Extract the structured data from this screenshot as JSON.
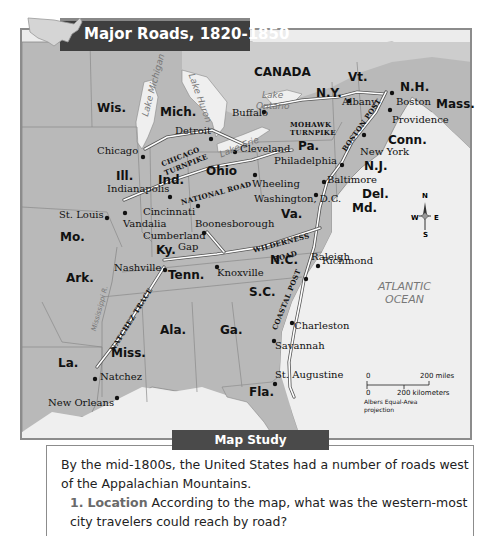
{
  "title": "Major Roads, 1820-1850",
  "country_label": "CANADA",
  "ocean_label": [
    "ATLANTIC",
    "OCEAN"
  ],
  "lakes": {
    "michigan": "Lake Michigan",
    "huron": "Lake Huron",
    "erie": "Lake Erie",
    "ontario_1": "Lake",
    "ontario_2": "Ontario"
  },
  "river": "Mississippi R.",
  "states": {
    "wis": "Wis.",
    "mich": "Mich.",
    "ny": "N.Y.",
    "vt": "Vt.",
    "nh": "N.H.",
    "mass": "Mass.",
    "conn": "Conn.",
    "pa": "Pa.",
    "nj": "N.J.",
    "del": "Del.",
    "md": "Md.",
    "ohio": "Ohio",
    "ind": "Ind.",
    "ill": "Ill.",
    "mo": "Mo.",
    "ky": "Ky.",
    "va": "Va.",
    "nc": "N.C.",
    "tenn": "Tenn.",
    "ark": "Ark.",
    "sc": "S.C.",
    "ala": "Ala.",
    "ga": "Ga.",
    "miss": "Miss.",
    "la": "La.",
    "fla": "Fla."
  },
  "cities": {
    "albany": "Albany",
    "boston": "Boston",
    "providence": "Providence",
    "buffalo": "Buffalo",
    "detroit": "Detroit",
    "chicago": "Chicago",
    "cleveland": "Cleveland",
    "new_york": "New York",
    "philadelphia": "Philadelphia",
    "baltimore": "Baltimore",
    "washington": "Washington, D.C.",
    "wheeling": "Wheeling",
    "indianapolis": "Indianapolis",
    "st_louis": "St. Louis",
    "cincinnati": "Cincinnati",
    "vandalia": "Vandalia",
    "boonesborough": "Boonesborough",
    "cumberland_gap_1": "Cumberland",
    "cumberland_gap_2": "Gap",
    "richmond": "Richmond",
    "nashville": "Nashville",
    "knoxville": "Knoxville",
    "raleigh": "Raleigh",
    "charleston": "Charleston",
    "savannah": "Savannah",
    "st_augustine": "St. Augustine",
    "natchez": "Natchez",
    "new_orleans": "New Orleans"
  },
  "roads": {
    "mohawk_1": "MOHAWK",
    "mohawk_2": "TURNPIKE",
    "boston_post": "BOSTON POST",
    "chicago_1": "CHICAGO",
    "chicago_2": "TURNPIKE",
    "national": "NATIONAL ROAD",
    "wilderness_1": "WILDERNESS",
    "wilderness_2": "ROAD",
    "natchez_trace": "NATCHEZ TRACE",
    "coastal_post": "COASTAL POST"
  },
  "compass": {
    "n": "N",
    "s": "S",
    "e": "E",
    "w": "W"
  },
  "scale": {
    "zero_top": "0",
    "miles": "200 miles",
    "zero_bottom": "0",
    "km": "200 kilometers",
    "projection_1": "Albers Equal-Area",
    "projection_2": "projection"
  },
  "map_study": {
    "heading": "Map Study",
    "intro": "By the mid-1800s, the United States had a number of roads west of the Appalachian Mountains.",
    "question_number": "1.",
    "question_keyword": "Location",
    "question_text": "According to the map, what was the western-most city travelers could reach by road?"
  },
  "colors": {
    "land": "#b8b8b8",
    "water": "#ececec",
    "title_bar": "#3f3f3f",
    "road": "#ffffff",
    "road_edge": "#555555"
  }
}
